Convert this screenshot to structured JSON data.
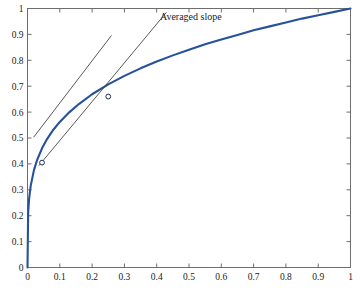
{
  "chart_data": {
    "type": "line",
    "title": "",
    "xlabel": "",
    "ylabel": "",
    "xlim": [
      0,
      1
    ],
    "ylim": [
      0,
      1
    ],
    "grid": false,
    "legend": "none",
    "xticks": [
      "0",
      "0.1",
      "0.2",
      "0.3",
      "0.4",
      "0.5",
      "0.6",
      "0.7",
      "0.8",
      "0.9",
      "1"
    ],
    "yticks": [
      "0",
      "0.1",
      "0.2",
      "0.3",
      "0.4",
      "0.5",
      "0.6",
      "0.7",
      "0.8",
      "0.9",
      "1"
    ],
    "xtick_values": [
      0,
      0.1,
      0.2,
      0.3,
      0.4,
      0.5,
      0.6,
      0.7,
      0.8,
      0.9,
      1
    ],
    "ytick_values": [
      0,
      0.1,
      0.2,
      0.3,
      0.4,
      0.5,
      0.6,
      0.7,
      0.8,
      0.9,
      1
    ],
    "series": [
      {
        "name": "curve",
        "color": "#26529b",
        "kind": "line",
        "x": [
          0,
          0.002,
          0.005,
          0.01,
          0.02,
          0.03,
          0.045,
          0.06,
          0.08,
          0.1,
          0.13,
          0.16,
          0.2,
          0.25,
          0.3,
          0.35,
          0.4,
          0.45,
          0.5,
          0.55,
          0.6,
          0.65,
          0.7,
          0.75,
          0.8,
          0.85,
          0.9,
          0.95,
          1
        ],
        "y": [
          0,
          0.21,
          0.266,
          0.316,
          0.376,
          0.416,
          0.46,
          0.495,
          0.532,
          0.562,
          0.6,
          0.632,
          0.669,
          0.707,
          0.74,
          0.769,
          0.795,
          0.819,
          0.841,
          0.862,
          0.88,
          0.898,
          0.916,
          0.931,
          0.946,
          0.961,
          0.974,
          0.987,
          1
        ]
      },
      {
        "name": "local-tangent-line",
        "color": "#3a3a3a",
        "kind": "line",
        "x": [
          0.019,
          0.26
        ],
        "y": [
          0.503,
          0.896
        ]
      },
      {
        "name": "averaged-slope-line",
        "color": "#3a3a3a",
        "kind": "line",
        "x": [
          0.035,
          0.43
        ],
        "y": [
          0.393,
          0.985
        ]
      }
    ],
    "markers": [
      {
        "name": "lower-point",
        "x": 0.045,
        "y": 0.405,
        "color": "#1b2d56"
      },
      {
        "name": "upper-point",
        "x": 0.25,
        "y": 0.66,
        "color": "#1b2d56"
      }
    ],
    "annotations": [
      {
        "name": "averaged-slope-label",
        "text": "Averaged slope",
        "x": 0.41,
        "y": 0.955
      }
    ]
  },
  "colors": {
    "curve": "#26529b",
    "slope_lines": "#3a3a3a",
    "axis": "#6d6d6d",
    "text": "#1a1a1a",
    "background": "#ffffff",
    "marker": "#1b2d56"
  }
}
